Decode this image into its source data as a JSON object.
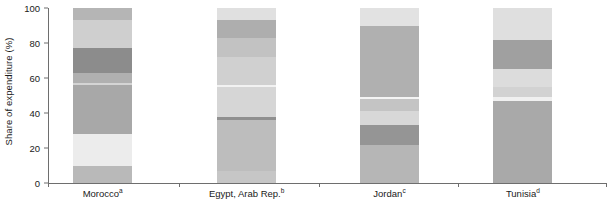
{
  "chart_data": {
    "type": "bar",
    "subtype": "stacked-100-percent",
    "title": "",
    "xlabel": "",
    "ylabel": "Share of expenditure (%)",
    "ylim": [
      0,
      100
    ],
    "yticks": [
      0,
      20,
      40,
      60,
      80,
      100
    ],
    "grid": false,
    "legend": "none",
    "categories": [
      "Moroccoᵃ",
      "Egypt, Arab Rep.ᵇ",
      "Jordanᶜ",
      "Tunisiaᵈ"
    ],
    "category_labels": [
      {
        "name": "Morocco",
        "footnote": "a"
      },
      {
        "name": "Egypt, Arab Rep.",
        "footnote": "b"
      },
      {
        "name": "Jordan",
        "footnote": "c"
      },
      {
        "name": "Tunisia",
        "footnote": "d"
      }
    ],
    "bars": [
      {
        "category": "Morocco",
        "footnote": "a",
        "center_pct": 9.8,
        "width_pct": 10.6,
        "segments": [
          {
            "from": 0,
            "to": 10,
            "value": 10,
            "color": "#b9b9b9"
          },
          {
            "from": 10,
            "to": 28,
            "value": 18,
            "color": "#ececec"
          },
          {
            "from": 28,
            "to": 56,
            "value": 28,
            "color": "#a8a8a8"
          },
          {
            "from": 56,
            "to": 57,
            "value": 1,
            "color": "#d4d4d4"
          },
          {
            "from": 57,
            "to": 63,
            "value": 6,
            "color": "#b0b0b0"
          },
          {
            "from": 63,
            "to": 77,
            "value": 14,
            "color": "#8c8c8c"
          },
          {
            "from": 77,
            "to": 93,
            "value": 16,
            "color": "#cfcfcf"
          },
          {
            "from": 93,
            "to": 100,
            "value": 7,
            "color": "#b5b5b5"
          }
        ]
      },
      {
        "category": "Egypt, Arab Rep.",
        "footnote": "b",
        "center_pct": 35.6,
        "width_pct": 10.6,
        "segments": [
          {
            "from": 0,
            "to": 7,
            "value": 7,
            "color": "#c6c6c6"
          },
          {
            "from": 7,
            "to": 36,
            "value": 29,
            "color": "#bdbdbd"
          },
          {
            "from": 36,
            "to": 38,
            "value": 2,
            "color": "#909090"
          },
          {
            "from": 38,
            "to": 55,
            "value": 17,
            "color": "#d6d6d6"
          },
          {
            "from": 55,
            "to": 56,
            "value": 1,
            "color": "#f2f2f2"
          },
          {
            "from": 56,
            "to": 72,
            "value": 16,
            "color": "#d0d0d0"
          },
          {
            "from": 72,
            "to": 83,
            "value": 11,
            "color": "#c2c2c2"
          },
          {
            "from": 83,
            "to": 93,
            "value": 10,
            "color": "#aeaeae"
          },
          {
            "from": 93,
            "to": 100,
            "value": 7,
            "color": "#e0e0e0"
          }
        ]
      },
      {
        "category": "Jordan",
        "footnote": "c",
        "center_pct": 61.2,
        "width_pct": 10.6,
        "segments": [
          {
            "from": 0,
            "to": 22,
            "value": 22,
            "color": "#b6b6b6"
          },
          {
            "from": 22,
            "to": 33,
            "value": 11,
            "color": "#959595"
          },
          {
            "from": 33,
            "to": 41,
            "value": 8,
            "color": "#d8d8d8"
          },
          {
            "from": 41,
            "to": 48,
            "value": 7,
            "color": "#c4c4c4"
          },
          {
            "from": 48,
            "to": 49,
            "value": 1,
            "color": "#f4f4f4"
          },
          {
            "from": 49,
            "to": 90,
            "value": 41,
            "color": "#b0b0b0"
          },
          {
            "from": 90,
            "to": 100,
            "value": 10,
            "color": "#e2e2e2"
          }
        ]
      },
      {
        "category": "Tunisia",
        "footnote": "d",
        "center_pct": 85.1,
        "width_pct": 10.6,
        "segments": [
          {
            "from": 0,
            "to": 47,
            "value": 47,
            "color": "#a9a9a9"
          },
          {
            "from": 47,
            "to": 49,
            "value": 2,
            "color": "#f0f0f0"
          },
          {
            "from": 49,
            "to": 55,
            "value": 6,
            "color": "#d2d2d2"
          },
          {
            "from": 55,
            "to": 65,
            "value": 10,
            "color": "#dcdcdc"
          },
          {
            "from": 65,
            "to": 82,
            "value": 17,
            "color": "#a0a0a0"
          },
          {
            "from": 82,
            "to": 100,
            "value": 18,
            "color": "#dfdfdf"
          }
        ]
      }
    ],
    "axis_color": "#6e6e6e",
    "text_color": "#1a1a1a",
    "background_color": "#ffffff"
  }
}
